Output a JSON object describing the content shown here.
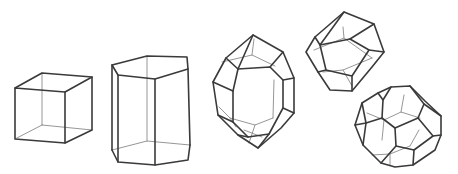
{
  "figure": {
    "stroke_color": "#3a3a3a",
    "hidden_stroke_color": "#8a8a8a",
    "background": "#ffffff",
    "shapes": [
      {
        "name": "cube",
        "label": ""
      },
      {
        "name": "pentagonal-prism",
        "label": ""
      },
      {
        "name": "elongated-polyhedron",
        "label": ""
      },
      {
        "name": "rhombic-dodecahedron",
        "label": ""
      },
      {
        "name": "truncated-octahedron",
        "label": ""
      }
    ]
  }
}
